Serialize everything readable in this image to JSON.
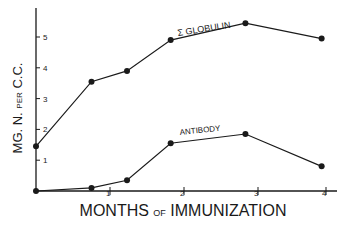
{
  "chart_data": {
    "type": "line",
    "title": "",
    "xlabel": "MONTHS of IMMUNIZATION",
    "ylabel": "MG. N. PER C.C.",
    "xlim": [
      0,
      4
    ],
    "ylim": [
      0,
      6
    ],
    "x_ticks": [
      "1",
      "2",
      "3",
      "4"
    ],
    "y_ticks": [
      "1",
      "2",
      "3",
      "4",
      "5"
    ],
    "grid": false,
    "legend": "inline labels",
    "series": [
      {
        "name": "Σ GLOBULIN",
        "x": [
          0,
          0.75,
          1.23,
          1.82,
          2.83,
          3.86
        ],
        "values": [
          1.45,
          3.55,
          3.9,
          4.9,
          5.45,
          4.95
        ]
      },
      {
        "name": "ANTIBODY",
        "x": [
          0,
          0.75,
          1.23,
          1.82,
          2.83,
          3.86
        ],
        "values": [
          0,
          0.1,
          0.35,
          1.55,
          1.85,
          0.8
        ]
      }
    ]
  },
  "labels": {
    "ylabel": "MG. N. PER C.C.",
    "ylabel_main": "MG. N.",
    "ylabel_small": "PER",
    "ylabel_end": "C.C.",
    "xlabel_main1": "MONTHS",
    "xlabel_small": "OF",
    "xlabel_main2": "IMMUNIZATION",
    "globulin": "Σ GLOBULIN",
    "antibody": "ANTIBODY"
  },
  "colors": {
    "ink": "#1a1a1a",
    "background": "#ffffff"
  }
}
